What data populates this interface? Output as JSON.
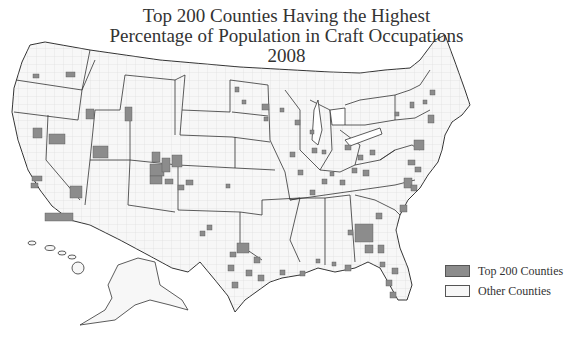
{
  "title": {
    "line1": "Top 200 Counties Having the Highest",
    "line2": "Percentage of Population in Craft Occupations",
    "line3": "2008"
  },
  "legend": {
    "items": [
      {
        "label": "Top 200 Counties",
        "color": "#8c8c8c"
      },
      {
        "label": "Other Counties",
        "color": "#f7f7f7"
      }
    ]
  },
  "map": {
    "region": "United States (counties, incl. Alaska and Hawaii insets)",
    "highlight_color": "#8c8c8c",
    "base_color": "#f7f7f7",
    "border_color": "#333333",
    "county_line_color": "#c8c8c8"
  }
}
